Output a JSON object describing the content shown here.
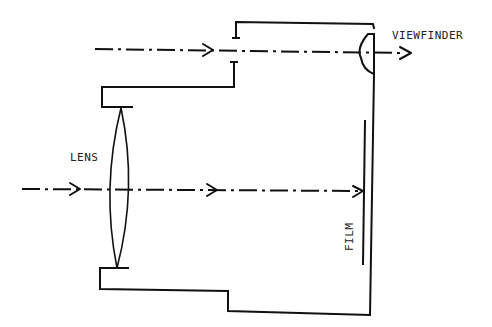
{
  "diagram": {
    "labels": {
      "viewfinder": "VIEWFINDER",
      "lens": "LENS",
      "film": "FILM"
    },
    "components": [
      {
        "id": "camera-body",
        "type": "outline"
      },
      {
        "id": "lens",
        "type": "biconvex-lens"
      },
      {
        "id": "viewfinder-eyepiece",
        "type": "plano-convex-lens"
      },
      {
        "id": "viewfinder-aperture",
        "type": "aperture"
      },
      {
        "id": "film",
        "type": "film-plane"
      }
    ],
    "rays": [
      {
        "id": "viewfinder-ray",
        "path": "aperture -> viewfinder eyepiece -> out"
      },
      {
        "id": "lens-ray",
        "path": "lens -> film"
      }
    ],
    "colors": {
      "stroke": "#111111",
      "background": "#ffffff"
    }
  }
}
